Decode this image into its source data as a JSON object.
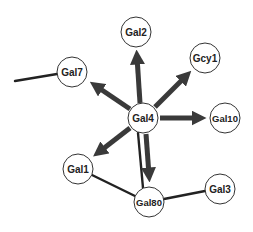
{
  "diagram": {
    "type": "gene-regulatory-network",
    "colors": {
      "edge": "#222222",
      "arrow": "#3a3a3a",
      "node_fill": "#ffffff",
      "node_stroke": "#333333"
    },
    "nodes": [
      {
        "id": "Gal4",
        "label": "Gal4",
        "x": 143,
        "y": 118,
        "r": 15
      },
      {
        "id": "Gal2",
        "label": "Gal2",
        "x": 136,
        "y": 32,
        "r": 15
      },
      {
        "id": "Gcy1",
        "label": "Gcy1",
        "x": 205,
        "y": 58,
        "r": 15
      },
      {
        "id": "Gal7",
        "label": "Gal7",
        "x": 72,
        "y": 72,
        "r": 15
      },
      {
        "id": "Gal10",
        "label": "Gal10",
        "x": 225,
        "y": 118,
        "r": 15
      },
      {
        "id": "Gal1",
        "label": "Gal1",
        "x": 78,
        "y": 169,
        "r": 15
      },
      {
        "id": "Gal80",
        "label": "Gal80",
        "x": 149,
        "y": 202,
        "r": 15
      },
      {
        "id": "Gal3",
        "label": "Gal3",
        "x": 220,
        "y": 189,
        "r": 15
      }
    ],
    "edges": [
      {
        "from": "Gal4",
        "to": "Gal2",
        "type": "arrow"
      },
      {
        "from": "Gal4",
        "to": "Gcy1",
        "type": "arrow"
      },
      {
        "from": "Gal4",
        "to": "Gal7",
        "type": "arrow"
      },
      {
        "from": "Gal4",
        "to": "Gal10",
        "type": "arrow"
      },
      {
        "from": "Gal4",
        "to": "Gal1",
        "type": "arrow"
      },
      {
        "from": "Gal4",
        "to": "Gal80",
        "type": "arrow"
      },
      {
        "from": "Gal4",
        "to": "Gal80",
        "type": "line"
      },
      {
        "from": "Gal1",
        "to": "Gal80",
        "type": "line"
      },
      {
        "from": "Gal80",
        "to": "Gal3",
        "type": "line"
      },
      {
        "from": "Gal7",
        "to": "offscreen-left",
        "type": "line"
      }
    ]
  }
}
